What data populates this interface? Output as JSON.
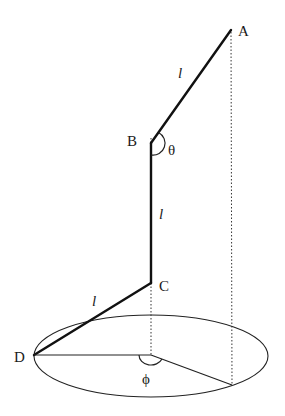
{
  "diagram": {
    "colors": {
      "stroke": "#111111",
      "dotted": "#333333",
      "background": "#ffffff"
    },
    "points": {
      "A": {
        "label": "A",
        "x": 231,
        "y": 30
      },
      "B": {
        "label": "B",
        "x": 151,
        "y": 143
      },
      "C": {
        "label": "C",
        "x": 151,
        "y": 283
      },
      "D": {
        "label": "D",
        "x": 34,
        "y": 355
      },
      "O": {
        "x": 151,
        "y": 355
      },
      "E": {
        "x": 232,
        "y": 385
      }
    },
    "segment_labels": {
      "AB": "l",
      "BC": "l",
      "CD": "l"
    },
    "angle_labels": {
      "theta": "θ",
      "phi": "ϕ"
    },
    "ellipse": {
      "cx": 151,
      "cy": 356,
      "rx": 117,
      "ry": 41
    }
  }
}
